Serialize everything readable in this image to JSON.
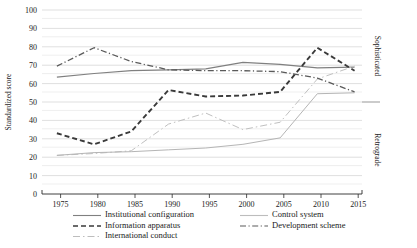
{
  "chart_data": {
    "type": "line",
    "title": "",
    "xlabel": "",
    "ylabel": "Standardized score",
    "xlim": [
      1973,
      2016
    ],
    "ylim": [
      0,
      100
    ],
    "grid": true,
    "grid_major_step": 10,
    "grid_minor_step": 5,
    "legend_position": "bottom",
    "x": [
      1975,
      1980,
      1985,
      1990,
      1995,
      2000,
      2005,
      2010,
      2015
    ],
    "x_tick_labels": [
      "1975",
      "1980",
      "1985",
      "1990",
      "1995",
      "2000",
      "2005",
      "2010",
      "2015"
    ],
    "y_tick_labels": [
      "0",
      "10",
      "20",
      "30",
      "40",
      "50",
      "60",
      "70",
      "80",
      "90",
      "100"
    ],
    "zone_labels": [
      {
        "name": "Sophisticated",
        "from": 50,
        "to": 100
      },
      {
        "name": "Retrograde",
        "from": 0,
        "to": 50
      }
    ],
    "zone_divider_value": 50,
    "series": [
      {
        "name": "Institutional configuration",
        "style": "solid",
        "color": "#808080",
        "values": [
          63.5,
          65.5,
          67.0,
          67.5,
          68.0,
          71.5,
          70.5,
          68.5,
          69.0
        ]
      },
      {
        "name": "Information apparatus",
        "style": "dashed",
        "color": "#3a3a3a",
        "values": [
          33.0,
          27.0,
          34.0,
          56.5,
          53.0,
          53.5,
          55.5,
          79.5,
          67.0
        ]
      },
      {
        "name": "International conduct",
        "style": "dotted",
        "color": "#c0c0c0",
        "values": [
          21.0,
          22.0,
          23.5,
          38.0,
          44.0,
          35.0,
          39.0,
          62.5,
          69.5
        ]
      },
      {
        "name": "Control system",
        "style": "solid-light",
        "color": "#b5b5b5",
        "values": [
          21.0,
          22.5,
          23.0,
          24.0,
          25.0,
          27.0,
          30.5,
          54.5,
          55.0
        ]
      },
      {
        "name": "Development scheme",
        "style": "dashdot",
        "color": "#5a5a5a",
        "values": [
          69.5,
          79.5,
          72.0,
          67.5,
          67.0,
          67.0,
          66.5,
          63.0,
          55.5
        ]
      }
    ]
  },
  "legend": {
    "column_left": [
      "Institutional configuration",
      "Information apparatus",
      "International conduct"
    ],
    "column_right": [
      "Control system",
      "Development scheme"
    ]
  }
}
